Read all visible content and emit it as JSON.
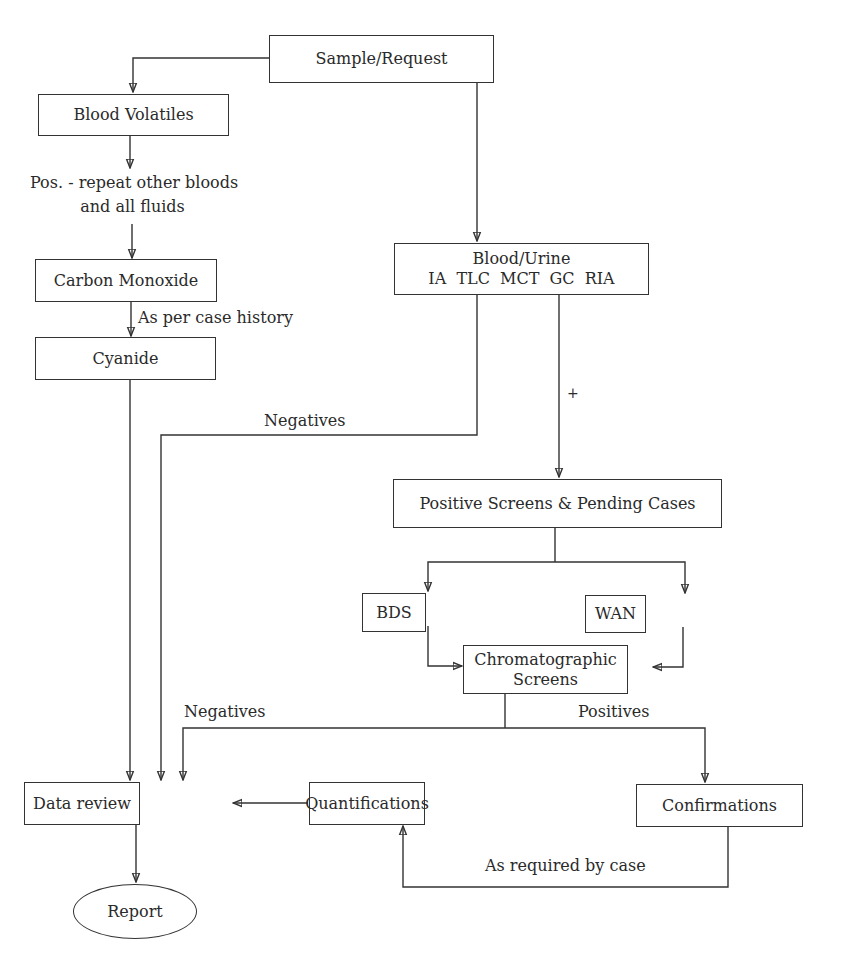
{
  "diagram": {
    "type": "flowchart",
    "nodes": {
      "sample_request": {
        "label": "Sample/Request"
      },
      "blood_volatiles": {
        "label": "Blood Volatiles"
      },
      "carbon_monoxide": {
        "label": "Carbon Monoxide"
      },
      "cyanide": {
        "label": "Cyanide"
      },
      "blood_urine": {
        "line1": "Blood/Urine",
        "line2": "IA  TLC  MCT  GC  RIA"
      },
      "positive_screens": {
        "label": "Positive Screens & Pending Cases"
      },
      "bds": {
        "label": "BDS"
      },
      "wan": {
        "label": "WAN"
      },
      "chromatographic": {
        "line1": "Chromatographic",
        "line2": "Screens"
      },
      "data_review": {
        "label": "Data review"
      },
      "quantifications": {
        "label": "Quantifications"
      },
      "confirmations": {
        "label": "Confirmations"
      },
      "report": {
        "label": "Report"
      }
    },
    "edge_labels": {
      "pos_repeat_line1": "Pos. - repeat other bloods",
      "pos_repeat_line2": "and all fluids",
      "as_per_case_history": "As per case history",
      "negatives_upper": "Negatives",
      "plus": "+",
      "negatives_lower": "Negatives",
      "positives": "Positives",
      "as_required_by_case": "As required by case"
    },
    "edges": [
      {
        "from": "Sample/Request",
        "to": "Blood Volatiles"
      },
      {
        "from": "Sample/Request",
        "to": "Blood/Urine"
      },
      {
        "from": "Blood Volatiles",
        "to": "Carbon Monoxide",
        "label": "Pos. - repeat other bloods and all fluids"
      },
      {
        "from": "Carbon Monoxide",
        "to": "Cyanide",
        "label": "As per case history"
      },
      {
        "from": "Cyanide",
        "to": "Data review"
      },
      {
        "from": "Blood/Urine",
        "to": "Data review",
        "label": "Negatives"
      },
      {
        "from": "Blood/Urine",
        "to": "Positive Screens & Pending Cases",
        "label": "+"
      },
      {
        "from": "Positive Screens & Pending Cases",
        "to": "BDS"
      },
      {
        "from": "Positive Screens & Pending Cases",
        "to": "WAN"
      },
      {
        "from": "BDS",
        "to": "Chromatographic Screens"
      },
      {
        "from": "WAN",
        "to": "Chromatographic Screens"
      },
      {
        "from": "Chromatographic Screens",
        "to": "Data review",
        "label": "Negatives"
      },
      {
        "from": "Chromatographic Screens",
        "to": "Confirmations",
        "label": "Positives"
      },
      {
        "from": "Confirmations",
        "to": "Quantifications",
        "label": "As required by case"
      },
      {
        "from": "Quantifications",
        "to": "Data review"
      },
      {
        "from": "Data review",
        "to": "Report"
      }
    ]
  }
}
